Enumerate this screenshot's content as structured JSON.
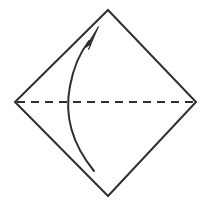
{
  "diagram": {
    "type": "origami-fold-step",
    "canvas": {
      "width": 211,
      "height": 205,
      "background": "#ffffff"
    },
    "colors": {
      "ink": "#2f2f2f",
      "background": "#ffffff"
    },
    "paper": {
      "name": "square-sheet-diamond-orientation",
      "shape": "square rotated 45 degrees (diamond)",
      "stroke_color": "#2f2f2f",
      "stroke_width": 2,
      "fill": "none",
      "vertices": {
        "top": [
          108,
          10
        ],
        "right": [
          196,
          102
        ],
        "bottom": [
          108,
          196
        ],
        "left": [
          15,
          102
        ]
      },
      "points": "108,10 196,102 108,196 15,102"
    },
    "crease": {
      "name": "horizontal-fold-line",
      "style": "dashed",
      "label": "valley fold line",
      "stroke_color": "#2f2f2f",
      "stroke_width": 2,
      "dash_pattern": "8 6",
      "start": [
        17,
        102
      ],
      "end": [
        194,
        102
      ]
    },
    "fold_arrow": {
      "name": "fold-direction-arrow",
      "description": "curved arrow from bottom vertex area sweeping up to top vertex",
      "stroke_color": "#2f2f2f",
      "stroke_width": 2,
      "curve_path": "M 94 171 C 72 144 64 116 70 86 C 74 64 82 50 89 41",
      "head_points": "98,27 86,46 90,43 87,42 90,45",
      "head_path": "M 98.5 26.5 L 85.5 47.5 L 91.0 44.0 L 88.5 49.5 Z",
      "tail": [
        94,
        171
      ],
      "tip": [
        98,
        27
      ]
    }
  }
}
